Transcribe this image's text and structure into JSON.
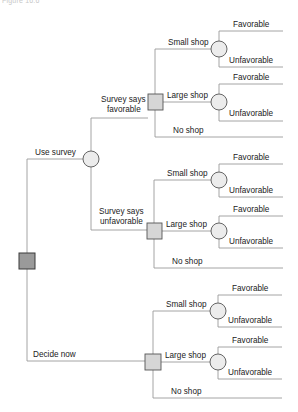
{
  "figure": {
    "caption": "Figure 16.6"
  },
  "tree": {
    "root": {
      "type": "decision",
      "color": "#9a9a9a"
    },
    "branches": {
      "use_survey": "Use survey",
      "decide_now": "Decide now"
    },
    "survey_outcomes": {
      "favorable_line1": "Survey says",
      "favorable_line2": "favorable",
      "unfavorable_line1": "Survey says",
      "unfavorable_line2": "unfavorable"
    },
    "groups": [
      {
        "name": "after-favorable-survey",
        "small_shop": "Small shop",
        "large_shop": "Large shop",
        "no_shop": "No shop",
        "small_outcomes": [
          "Favorable",
          "Unfavorable"
        ],
        "large_outcomes": [
          "Favorable",
          "Unfavorable"
        ]
      },
      {
        "name": "after-unfavorable-survey",
        "small_shop": "Small shop",
        "large_shop": "Large shop",
        "no_shop": "No shop",
        "small_outcomes": [
          "Favorable",
          "Unfavorable"
        ],
        "large_outcomes": [
          "Favorable",
          "Unfavorable"
        ]
      },
      {
        "name": "decide-now",
        "small_shop": "Small shop",
        "large_shop": "Large shop",
        "no_shop": "No shop",
        "small_outcomes": [
          "Favorable",
          "Unfavorable"
        ],
        "large_outcomes": [
          "Favorable",
          "Unfavorable"
        ]
      }
    ],
    "colors": {
      "edge": "#9a9a9a",
      "chance_fill": "#ececec",
      "decision_fill": "#d6d6d6",
      "root_fill": "#9a9a9a"
    }
  }
}
